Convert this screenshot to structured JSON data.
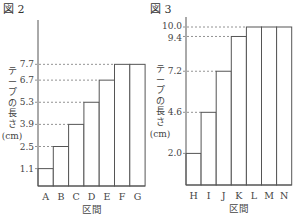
{
  "chart_data": [
    {
      "type": "bar",
      "title": "図 2",
      "xlabel": "区間",
      "ylabel": "テープの長さ(cm)",
      "ylabel_lines": [
        "テ",
        "ー",
        "プ",
        "の",
        "長",
        "さ",
        "(cm)"
      ],
      "categories": [
        "A",
        "B",
        "C",
        "D",
        "E",
        "F",
        "G"
      ],
      "values": [
        1.1,
        2.5,
        3.9,
        5.3,
        6.7,
        7.7,
        7.7
      ],
      "yticks": [
        1.1,
        2.5,
        3.9,
        5.3,
        6.7,
        7.7
      ],
      "ytick_labels": [
        "1.1",
        "2.5",
        "3.9",
        "5.3",
        "6.7",
        "7.7"
      ],
      "grid": false,
      "guide_lines": "dashed lines from y-axis to top of each distinct bar"
    },
    {
      "type": "bar",
      "title": "図 3",
      "xlabel": "区間",
      "ylabel": "テープの長さ(cm)",
      "ylabel_lines": [
        "テ",
        "ー",
        "プ",
        "の",
        "長",
        "さ",
        "(cm)"
      ],
      "categories": [
        "H",
        "I",
        "J",
        "K",
        "L",
        "M",
        "N"
      ],
      "values": [
        2.0,
        4.6,
        7.2,
        9.4,
        10.0,
        10.0,
        10.0
      ],
      "yticks": [
        2.0,
        4.6,
        7.2,
        9.4,
        10.0
      ],
      "ytick_labels": [
        "2.0",
        "4.6",
        "7.2",
        "9.4",
        "10.0"
      ],
      "grid": false,
      "guide_lines": "dashed lines from y-axis to top of each distinct bar"
    }
  ]
}
